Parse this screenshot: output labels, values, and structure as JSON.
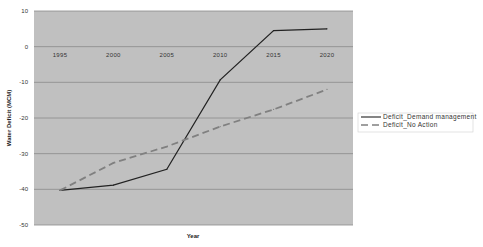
{
  "chart_data": {
    "type": "line",
    "title": "",
    "xlabel": "Year",
    "ylabel": "Water Deficit (MCM)",
    "categories": [
      "1995",
      "2000",
      "2005",
      "2010",
      "2015",
      "2020"
    ],
    "ylim": [
      -50,
      10
    ],
    "yticks": [
      10,
      0,
      -10,
      -20,
      -30,
      -40,
      -50
    ],
    "grid": true,
    "legend_position": "right",
    "series": [
      {
        "name": "Deficit_Demand management",
        "style": "solid",
        "color": "#222222",
        "values": [
          -40.3,
          -38.8,
          -34.4,
          -9.3,
          4.5,
          5.0
        ]
      },
      {
        "name": "Deficit_No Action",
        "style": "dashed",
        "color": "#808080",
        "values": [
          -40.3,
          -32.6,
          -28.0,
          -22.4,
          -17.6,
          -12.0
        ]
      }
    ]
  },
  "colors": {
    "plot_background": "#c0c0c0",
    "gridline": "#8a8a8a"
  }
}
